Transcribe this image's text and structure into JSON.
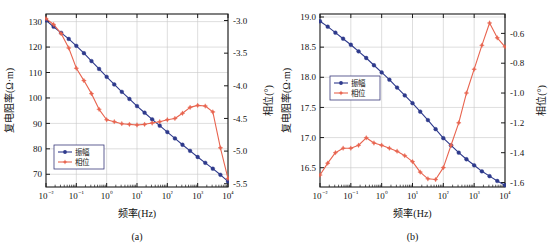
{
  "figure": {
    "background": "#ffffff",
    "series_colors": {
      "amplitude": "#2e3a8c",
      "phase": "#e8644f"
    },
    "axis_color": "#1a1a1a",
    "grid_color": "#c8c8c8"
  },
  "panels": [
    {
      "id": "a",
      "caption": "(a)",
      "legend": {
        "amplitude": "振幅",
        "phase": "相位"
      },
      "chart_data": {
        "type": "line",
        "title": "",
        "xlabel": "频率(Hz)",
        "ylabel": "复电阻率(Ω·m)",
        "y2label": "相位(°)",
        "xscale": "log",
        "xlim": [
          0.01,
          10000
        ],
        "xticklabels": [
          "10⁻²",
          "10⁻¹",
          "10⁰",
          "10¹",
          "10²",
          "10³",
          "10⁴"
        ],
        "xticks": [
          0.01,
          0.1,
          1,
          10,
          100,
          1000,
          10000
        ],
        "ylim": [
          65,
          133
        ],
        "yticks": [
          70,
          80,
          90,
          100,
          110,
          120,
          130
        ],
        "yticklabels": [
          "70",
          "80",
          "90",
          "100",
          "110",
          "120",
          "130"
        ],
        "y2lim": [
          -5.55,
          -2.9
        ],
        "y2ticks": [
          -3.0,
          -3.5,
          -4.0,
          -4.5,
          -5.0,
          -5.5
        ],
        "y2ticklabels": [
          "-3.0",
          "-3.5",
          "-4.0",
          "-4.5",
          "-5.0",
          "-5.5"
        ],
        "grid": true,
        "legend_position": "lower-left",
        "series": [
          {
            "name": "振幅",
            "axis": "left",
            "marker": "circle",
            "x": [
              0.01,
              0.0178,
              0.0316,
              0.0562,
              0.1,
              0.178,
              0.316,
              0.562,
              1,
              1.78,
              3.16,
              5.62,
              10,
              17.8,
              31.6,
              56.2,
              100,
              178,
              316,
              562,
              1000,
              1780,
              3160,
              5620,
              10000
            ],
            "y": [
              130.5,
              128.0,
              125.6,
              123.2,
              120.5,
              117.6,
              114.5,
              111.4,
              108.3,
              105.3,
              102.4,
              99.6,
              96.8,
              94.2,
              91.6,
              89.1,
              86.6,
              84.1,
              81.6,
              79.2,
              76.8,
              74.5,
              72.2,
              69.8,
              67.2
            ]
          },
          {
            "name": "相位",
            "axis": "right",
            "marker": "star",
            "x": [
              0.01,
              0.0178,
              0.0316,
              0.0562,
              0.1,
              0.178,
              0.316,
              0.562,
              1,
              1.78,
              3.16,
              5.62,
              10,
              17.8,
              31.6,
              56.2,
              100,
              178,
              316,
              562,
              1000,
              1780,
              3160,
              5620,
              10000
            ],
            "y": [
              -2.97,
              -3.06,
              -3.2,
              -3.42,
              -3.73,
              -3.92,
              -4.12,
              -4.36,
              -4.52,
              -4.55,
              -4.58,
              -4.59,
              -4.6,
              -4.59,
              -4.57,
              -4.55,
              -4.52,
              -4.5,
              -4.42,
              -4.33,
              -4.3,
              -4.31,
              -4.4,
              -4.95,
              -5.42
            ]
          }
        ]
      }
    },
    {
      "id": "b",
      "caption": "(b)",
      "legend": {
        "amplitude": "振幅",
        "phase": "相位"
      },
      "chart_data": {
        "type": "line",
        "title": "",
        "xlabel": "频率(Hz)",
        "ylabel": "复电阻率(Ω·m)",
        "y2label": "相位(°)",
        "xscale": "log",
        "xlim": [
          0.01,
          10000
        ],
        "xticklabels": [
          "10⁻²",
          "10⁻¹",
          "10⁰",
          "10¹",
          "10²",
          "10³",
          "10⁴"
        ],
        "xticks": [
          0.01,
          0.1,
          1,
          10,
          100,
          1000,
          10000
        ],
        "ylim": [
          16.18,
          19.05
        ],
        "yticks": [
          16.5,
          17.0,
          17.5,
          18.0,
          18.5,
          19.0
        ],
        "yticklabels": [
          "16.5",
          "17.0",
          "17.5",
          "18.0",
          "18.5",
          "19.0"
        ],
        "y2lim": [
          -1.63,
          -0.47
        ],
        "y2ticks": [
          -0.6,
          -0.8,
          -1.0,
          -1.2,
          -1.4,
          -1.6
        ],
        "y2ticklabels": [
          "-0.6",
          "-0.8",
          "-1.0",
          "-1.2",
          "-1.4",
          "-1.6"
        ],
        "grid": true,
        "legend_position": "middle-left",
        "series": [
          {
            "name": "振幅",
            "axis": "left",
            "marker": "circle",
            "x": [
              0.01,
              0.0178,
              0.0316,
              0.0562,
              0.1,
              0.178,
              0.316,
              0.562,
              1,
              1.78,
              3.16,
              5.62,
              10,
              17.8,
              31.6,
              56.2,
              100,
              178,
              316,
              562,
              1000,
              1780,
              3160,
              5620,
              10000
            ],
            "y": [
              18.93,
              18.84,
              18.74,
              18.64,
              18.54,
              18.43,
              18.32,
              18.2,
              18.08,
              17.96,
              17.83,
              17.7,
              17.57,
              17.43,
              17.29,
              17.14,
              16.99,
              16.87,
              16.75,
              16.64,
              16.54,
              16.44,
              16.36,
              16.28,
              16.21
            ]
          },
          {
            "name": "相位",
            "axis": "right",
            "marker": "star",
            "x": [
              0.01,
              0.0178,
              0.0316,
              0.0562,
              0.1,
              0.178,
              0.316,
              0.562,
              1,
              1.78,
              3.16,
              5.62,
              10,
              17.8,
              31.6,
              56.2,
              100,
              178,
              316,
              562,
              1000,
              1780,
              3160,
              5620,
              10000
            ],
            "y": [
              -1.55,
              -1.47,
              -1.4,
              -1.37,
              -1.37,
              -1.35,
              -1.3,
              -1.335,
              -1.35,
              -1.37,
              -1.39,
              -1.42,
              -1.46,
              -1.53,
              -1.575,
              -1.58,
              -1.5,
              -1.35,
              -1.2,
              -1.0,
              -0.84,
              -0.68,
              -0.53,
              -0.63,
              -0.69
            ]
          }
        ]
      }
    }
  ]
}
